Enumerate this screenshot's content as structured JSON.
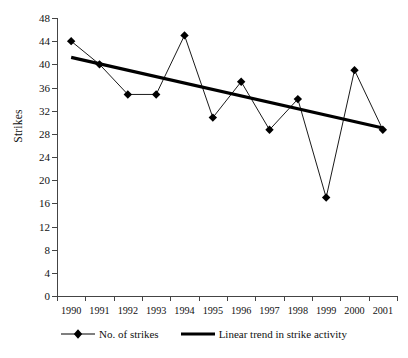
{
  "chart_data": {
    "type": "line",
    "title": "",
    "xlabel": "",
    "ylabel": "Strikes",
    "categories": [
      "1990",
      "1991",
      "1992",
      "1993",
      "1994",
      "1995",
      "1996",
      "1997",
      "1998",
      "1999",
      "2000",
      "2001"
    ],
    "ylim": [
      0,
      48
    ],
    "yticks": [
      0,
      4,
      8,
      12,
      16,
      20,
      24,
      28,
      32,
      36,
      40,
      44,
      48
    ],
    "ytick_labels": [
      "0",
      "4",
      "8",
      "12",
      "16",
      "20",
      "24",
      "28",
      "32",
      "36",
      "40",
      "44",
      "48"
    ],
    "grid": false,
    "legend_position": "bottom",
    "series": [
      {
        "name": "No. of strikes",
        "marker": "diamond",
        "color": "#000000",
        "values": [
          44,
          40,
          34.8,
          34.8,
          45,
          30.8,
          37,
          28.7,
          34,
          17,
          39,
          28.7
        ]
      },
      {
        "name": "Linear trend in strike activity",
        "marker": "none",
        "color": "#000000",
        "values": [
          41.2,
          40.1,
          39.0,
          37.9,
          36.8,
          35.7,
          34.6,
          33.5,
          32.3,
          31.2,
          30.1,
          29.0
        ]
      }
    ]
  },
  "legend": {
    "items": [
      {
        "label": "No. of strikes",
        "kind": "marker-line"
      },
      {
        "label": "Linear trend in strike activity",
        "kind": "thick-line"
      }
    ]
  }
}
